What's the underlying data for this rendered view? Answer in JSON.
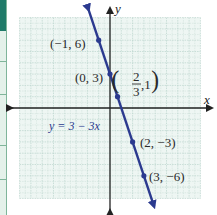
{
  "chart_data": {
    "type": "line",
    "title": "",
    "equation": "y = 3 − 3x",
    "xlabel": "x",
    "ylabel": "y",
    "xlim": [
      -8,
      8
    ],
    "ylim": [
      -8,
      8
    ],
    "grid": true,
    "series": [
      {
        "name": "y = 3 − 3x",
        "slope": -3,
        "intercept": 3,
        "color": "#2b3a8f",
        "points": [
          {
            "x": -1,
            "y": 6,
            "label": "(−1, 6)"
          },
          {
            "x": 0,
            "y": 3,
            "label": "(0, 3)"
          },
          {
            "x": 0.6667,
            "y": 1,
            "label": "(2/3, 1)"
          },
          {
            "x": 2,
            "y": -3,
            "label": "(2, −3)"
          },
          {
            "x": 3,
            "y": -6,
            "label": "(3, −6)"
          }
        ]
      }
    ]
  },
  "labels": {
    "x_axis": "x",
    "y_axis": "y",
    "equation": "y = 3 − 3x",
    "p1": "(−1, 6)",
    "p2": "(0, 3)",
    "p3_num": "2",
    "p3_den": "3",
    "p3_y": ",1",
    "p4": "(2, −3)",
    "p5": "(3, −6)"
  },
  "colors": {
    "line": "#2b3a8f",
    "grid": "#b9d4cc",
    "grid_bg": "#eef6f3",
    "axis": "#222222",
    "strip_dark": "#1f7a68",
    "strip_light": "#e4f1ea"
  }
}
